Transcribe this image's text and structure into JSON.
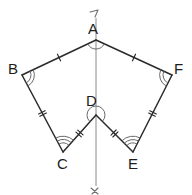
{
  "figure": {
    "stroke_color": "#2b2b2b",
    "axis_color": "#8a8a8a",
    "arc_color": "#6a6a6a",
    "background": "#ffffff"
  },
  "labels": {
    "A": "A",
    "B": "B",
    "C": "C",
    "D": "D",
    "E": "E",
    "F": "F",
    "axis_top": "ア",
    "axis_bottom": "イ"
  },
  "vertices": [
    {
      "name": "A",
      "label": "A",
      "x": 96,
      "y": 40,
      "label_x": 88,
      "label_y": 34,
      "arcs": 1,
      "reflex": false
    },
    {
      "name": "B",
      "label": "B",
      "x": 22,
      "y": 75,
      "label_x": 8,
      "label_y": 74,
      "arcs": 2,
      "reflex": false
    },
    {
      "name": "C",
      "label": "C",
      "x": 63,
      "y": 152,
      "label_x": 57,
      "label_y": 169,
      "arcs": 3,
      "reflex": false
    },
    {
      "name": "D",
      "label": "D",
      "x": 96,
      "y": 115,
      "label_x": 86,
      "label_y": 106,
      "arcs": 1,
      "reflex": true
    },
    {
      "name": "E",
      "label": "E",
      "x": 133,
      "y": 152,
      "label_x": 128,
      "label_y": 169,
      "arcs": 3,
      "reflex": false
    },
    {
      "name": "F",
      "label": "F",
      "x": 172,
      "y": 75,
      "label_x": 174,
      "label_y": 74,
      "arcs": 2,
      "reflex": false
    }
  ],
  "edges": [
    {
      "name": "AB",
      "from": "A",
      "to": "B",
      "ticks": 1
    },
    {
      "name": "BC",
      "from": "B",
      "to": "C",
      "ticks": 2
    },
    {
      "name": "CD",
      "from": "C",
      "to": "D",
      "ticks": 2
    },
    {
      "name": "DE",
      "from": "D",
      "to": "E",
      "ticks": 2
    },
    {
      "name": "EF",
      "from": "E",
      "to": "F",
      "ticks": 2
    },
    {
      "name": "FA",
      "from": "F",
      "to": "A",
      "ticks": 1
    }
  ],
  "symmetry_axis": {
    "x": 96,
    "y_top": 18,
    "y_bottom": 186,
    "top_label": "ア",
    "bottom_label": "イ"
  }
}
